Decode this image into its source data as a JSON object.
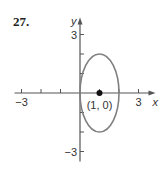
{
  "problem": {
    "number": "27."
  },
  "chart_data": {
    "type": "line",
    "title": "",
    "xlabel": "x",
    "ylabel": "y",
    "xlim": [
      -3,
      3
    ],
    "ylim": [
      -3,
      3
    ],
    "x_ticks": [
      -3,
      -2,
      -1,
      1,
      2,
      3
    ],
    "y_ticks": [
      -3,
      -2,
      -1,
      1,
      2,
      3
    ],
    "x_tick_labels": [
      {
        "value": -3,
        "label": "−3"
      },
      {
        "value": 3,
        "label": "3"
      }
    ],
    "y_tick_labels": [
      {
        "value": 3,
        "label": "3"
      },
      {
        "value": -3,
        "label": "−3"
      }
    ],
    "grid": false,
    "series": [
      {
        "name": "ellipse",
        "shape": "ellipse",
        "center": [
          1,
          0
        ],
        "semi_axis_x": 1,
        "semi_axis_y": 2,
        "color": "#808080"
      }
    ],
    "points": [
      {
        "x": 1,
        "y": 0,
        "label": "(1, 0)",
        "color": "#111111"
      }
    ],
    "axis_color": "#555555"
  }
}
